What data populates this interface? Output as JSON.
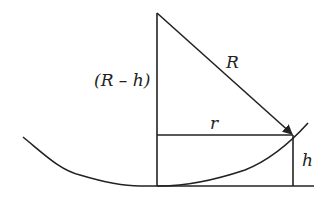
{
  "diagram": {
    "type": "geometry",
    "labels": {
      "radius": "R",
      "center_height": "(R – h)",
      "half_chord": "r",
      "sag": "h"
    },
    "colors": {
      "stroke": "#222222",
      "background": "#ffffff"
    }
  }
}
